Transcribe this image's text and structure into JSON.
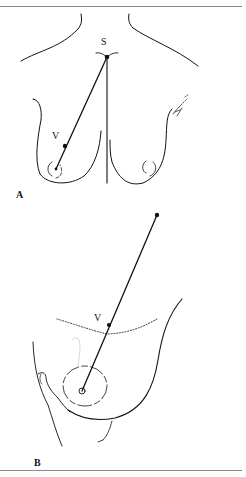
{
  "figure": {
    "panel_a": {
      "label": "A",
      "points": {
        "sternal_notch": "S",
        "nipple_line_point": "V"
      }
    },
    "panel_b": {
      "label": "B",
      "points": {
        "marked_point": "V"
      }
    },
    "colors": {
      "ink": "#111111",
      "rule": "#8a8a8a",
      "background": "#ffffff"
    }
  }
}
